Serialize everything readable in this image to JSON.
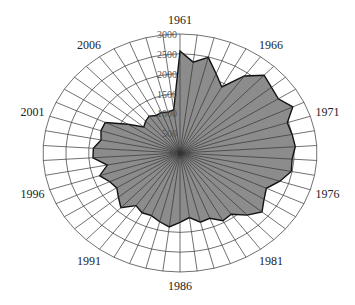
{
  "chart_data": {
    "type": "radar",
    "title": "",
    "xlabel": "",
    "ylabel": "",
    "categories": [
      1961,
      1962,
      1963,
      1964,
      1965,
      1966,
      1967,
      1968,
      1969,
      1970,
      1971,
      1972,
      1973,
      1974,
      1975,
      1976,
      1977,
      1978,
      1979,
      1980,
      1981,
      1982,
      1983,
      1984,
      1985,
      1986,
      1987,
      1988,
      1989,
      1990,
      1991,
      1992,
      1993,
      1994,
      1995,
      1996,
      1997,
      1998,
      1999,
      2000,
      2001,
      2002,
      2003,
      2004,
      2005,
      2006,
      2007,
      2008,
      2009,
      2010
    ],
    "labeled_categories": [
      "1961",
      "1966",
      "1971",
      "1976",
      "1981",
      "1986",
      "1991",
      "1996",
      "2001",
      "2006"
    ],
    "series": [
      {
        "name": "value",
        "values": [
          2570,
          2310,
          2490,
          2150,
          1900,
          2400,
          2690,
          2600,
          2550,
          2730,
          2470,
          2500,
          2530,
          2460,
          2480,
          2300,
          2090,
          2180,
          2330,
          2150,
          1910,
          1950,
          1770,
          1800,
          1640,
          1750,
          1880,
          1790,
          1700,
          1720,
          1640,
          1890,
          1750,
          1640,
          1700,
          1850,
          1620,
          1910,
          1900,
          1760,
          1820,
          1810,
          1350,
          1030,
          1100,
          1150,
          1080,
          1100,
          1060,
          1100
        ]
      }
    ],
    "radial_ticks": [
      "0",
      "500",
      "1000",
      "1500",
      "2000",
      "2500",
      "3000"
    ],
    "ylim": [
      0,
      3000
    ],
    "grid": true,
    "legend": "none",
    "colors": {
      "fill": "#8c8c8c",
      "outline": "#111111",
      "grid": "#333333"
    }
  }
}
